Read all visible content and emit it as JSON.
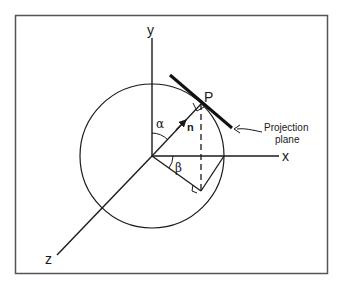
{
  "diagram": {
    "type": "3d-coordinate-projection",
    "axes": {
      "x_label": "x",
      "y_label": "y",
      "z_label": "z"
    },
    "point_label": "P",
    "normal_label": "n",
    "angle_alpha": "α",
    "angle_beta": "β",
    "plane_label_line1": "Projection",
    "plane_label_line2": "plane",
    "colors": {
      "stroke": "#1a1a1a",
      "frame": "#555555",
      "background": "#ffffff"
    }
  }
}
